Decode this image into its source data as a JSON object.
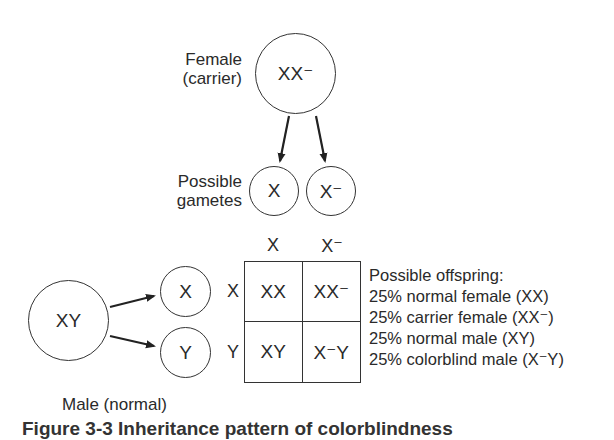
{
  "female": {
    "label_line1": "Female",
    "label_line2": "(carrier)",
    "genotype": "XX⁻"
  },
  "female_gametes": {
    "label_line1": "Possible",
    "label_line2": "gametes",
    "items": [
      "X",
      "X⁻"
    ]
  },
  "male": {
    "genotype": "XY",
    "label": "Male (normal)",
    "gametes": [
      "X",
      "Y"
    ]
  },
  "punnett": {
    "col_headers": [
      "X",
      "X⁻"
    ],
    "row_headers": [
      "X",
      "Y"
    ],
    "cells": [
      [
        "XX",
        "XX⁻"
      ],
      [
        "XY",
        "X⁻Y"
      ]
    ]
  },
  "offspring": {
    "title": "Possible offspring:",
    "items": [
      "25% normal female (XX)",
      "25% carrier female (XX⁻)",
      "25% normal male (XY)",
      "25% colorblind male (X⁻Y)"
    ]
  },
  "caption": "Figure 3-3 Inheritance pattern of colorblindness"
}
